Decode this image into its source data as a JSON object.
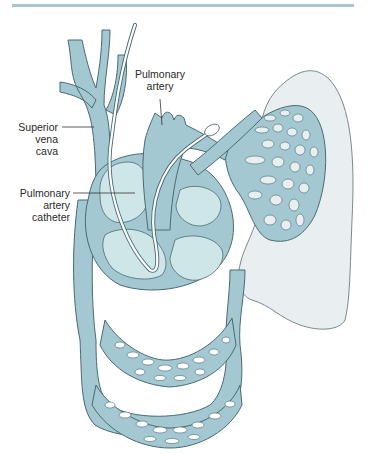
{
  "figure": {
    "labels": {
      "superior_vena_cava": [
        "Superior",
        "vena",
        "cava"
      ],
      "pulmonary_artery": [
        "Pulmonary",
        "artery"
      ],
      "pulmonary_artery_catheter": [
        "Pulmonary",
        "artery",
        "catheter"
      ]
    },
    "colors": {
      "top_rule": "#a9c6cf",
      "vessel_fill": "#a3c8d1",
      "vessel_stroke": "#4a6a72",
      "chamber_fill": "#cfe6e8",
      "lung_fill": "#e9eef0",
      "lung_stroke": "#7a8a90",
      "catheter": "#ffffff",
      "leader_line": "#333333",
      "text": "#2a2a2a"
    }
  }
}
